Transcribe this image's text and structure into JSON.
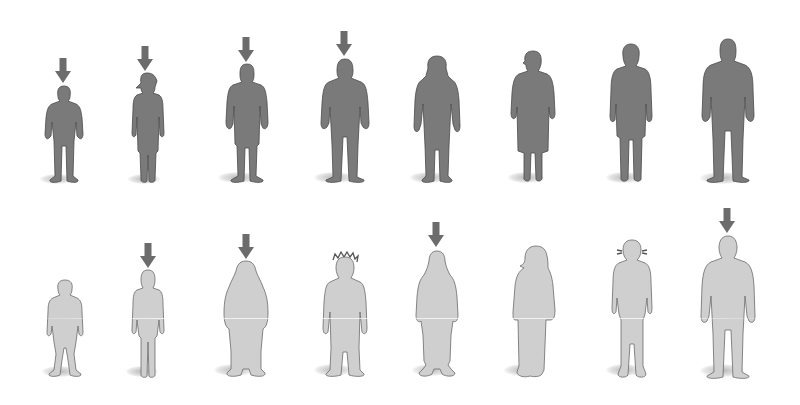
{
  "illustration": {
    "description": "Two rows of human silhouettes of varying body types; arrows mark selected figures",
    "colors": {
      "dark_figure_fill": "#7a7a7a",
      "dark_figure_stroke": "#4a4a4a",
      "light_figure_fill": "#cfcfcf",
      "light_figure_stroke": "#6a6a6a",
      "arrow_fill": "#6c6c6c",
      "background": "#ffffff"
    },
    "rows": [
      {
        "name": "top-row",
        "tone": "dark",
        "figures": [
          {
            "type": "boy",
            "arrow": true
          },
          {
            "type": "girl-ponytail",
            "arrow": true
          },
          {
            "type": "man-shorts",
            "arrow": true
          },
          {
            "type": "man-tall",
            "arrow": true
          },
          {
            "type": "woman-long-hair",
            "arrow": false
          },
          {
            "type": "woman-skirt",
            "arrow": false
          },
          {
            "type": "woman-dress",
            "arrow": false
          },
          {
            "type": "man-large",
            "arrow": false
          }
        ]
      },
      {
        "name": "bottom-row",
        "tone": "light",
        "figures": [
          {
            "type": "child-stocky",
            "arrow": false
          },
          {
            "type": "girl-slim",
            "arrow": true
          },
          {
            "type": "person-robed",
            "arrow": true
          },
          {
            "type": "person-spiky-hair",
            "arrow": false
          },
          {
            "type": "woman-long-dress",
            "arrow": true
          },
          {
            "type": "woman-headscarf-robe",
            "arrow": false
          },
          {
            "type": "woman-bun-hair",
            "arrow": false
          },
          {
            "type": "man-broad",
            "arrow": true
          }
        ]
      }
    ]
  }
}
